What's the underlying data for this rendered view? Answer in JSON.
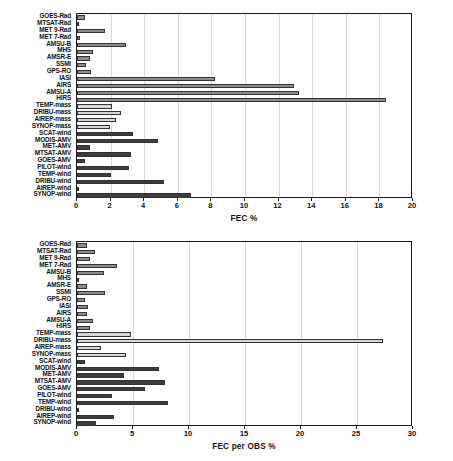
{
  "chart_data": [
    {
      "type": "bar",
      "orientation": "horizontal",
      "title": "",
      "xlabel": "FEC %",
      "ylabel": "",
      "xlim": [
        0,
        20
      ],
      "xticks": [
        0,
        2,
        4,
        6,
        8,
        10,
        12,
        14,
        16,
        18,
        20
      ],
      "xticklabels": [
        "0",
        "2",
        "4",
        "6",
        "8",
        "10",
        "12",
        "14",
        "16",
        "18",
        "20"
      ],
      "grid": "vertical",
      "legend": "none",
      "categories": [
        "GOES-Rad",
        "MTSAT-Rad",
        "MET 9-Rad",
        "MET 7-Rad",
        "AMSU-B",
        "MHS",
        "AMSR-E",
        "SSMI",
        "GPS-RO",
        "IASI",
        "AIRS",
        "AMSU-A",
        "HIRS",
        "TEMP-mass",
        "DRIBU-mass",
        "AIREP-mass",
        "SYNOP-mass",
        "SCAT-wind",
        "MODIS-AMV",
        "MET-AMV",
        "MTSAT-AMV",
        "GOES-AMV",
        "PILOT-wind",
        "TEMP-wind",
        "DRIBU-wind",
        "AIREP-wind",
        "SYNOP-wind"
      ],
      "values": [
        0.45,
        0.1,
        1.65,
        0.2,
        2.9,
        0.95,
        0.75,
        0.55,
        0.85,
        8.2,
        12.9,
        13.2,
        18.4,
        2.1,
        2.6,
        2.3,
        1.95,
        3.35,
        4.8,
        0.8,
        3.2,
        0.5,
        3.1,
        2.0,
        5.15,
        0.05,
        6.8
      ],
      "group_of_category": [
        "radiance",
        "radiance",
        "radiance",
        "radiance",
        "radiance",
        "radiance",
        "radiance",
        "radiance",
        "radiance",
        "radiance",
        "radiance",
        "radiance",
        "radiance",
        "mass",
        "mass",
        "mass",
        "mass",
        "wind",
        "wind",
        "wind",
        "wind",
        "wind",
        "wind",
        "wind",
        "wind",
        "wind",
        "wind"
      ]
    },
    {
      "type": "bar",
      "orientation": "horizontal",
      "title": "",
      "xlabel": "FEC per OBS %",
      "ylabel": "",
      "xlim": [
        0,
        30
      ],
      "xticks": [
        0,
        5,
        10,
        15,
        20,
        25,
        30
      ],
      "xticklabels": [
        "0",
        "5",
        "10",
        "15",
        "20",
        "25",
        "30"
      ],
      "grid": "vertical",
      "legend": "none",
      "categories": [
        "GOES-Rad",
        "MTSAT-Rad",
        "MET 9-Rad",
        "MET 7-Rad",
        "AMSU-B",
        "MHS",
        "AMSR-E",
        "SSMI",
        "GPS-RO",
        "IASI",
        "AIRS",
        "AMSU-A",
        "HIRS",
        "TEMP-mass",
        "DRIBU-mass",
        "AIREP-mass",
        "SYNOP-mass",
        "SCAT-wind",
        "MODIS-AMV",
        "MET-AMV",
        "MTSAT-AMV",
        "GOES-AMV",
        "PILOT-wind",
        "TEMP-wind",
        "DRIBU-wind",
        "AIREP-wind",
        "SYNOP-wind"
      ],
      "values": [
        0.9,
        1.6,
        1.2,
        3.6,
        2.4,
        0.2,
        0.9,
        2.5,
        0.7,
        0.95,
        0.85,
        1.4,
        1.15,
        4.8,
        27.3,
        2.1,
        4.4,
        0.75,
        7.3,
        4.2,
        7.9,
        6.1,
        3.1,
        8.1,
        0.2,
        3.3,
        1.7
      ],
      "group_of_category": [
        "radiance",
        "radiance",
        "radiance",
        "radiance",
        "radiance",
        "radiance",
        "radiance",
        "radiance",
        "radiance",
        "radiance",
        "radiance",
        "radiance",
        "radiance",
        "mass",
        "mass",
        "mass",
        "mass",
        "wind",
        "wind",
        "wind",
        "wind",
        "wind",
        "wind",
        "wind",
        "wind",
        "wind",
        "wind"
      ]
    }
  ],
  "colors": {
    "radiance": "#8c8c8c",
    "mass": "#d6d6d6",
    "wind": "#3d3d3d",
    "bar_edge": "#333333",
    "gridline": "#d9d9d9",
    "axis": "#1a1a1a",
    "background": "#ffffff",
    "text": "#111111"
  }
}
